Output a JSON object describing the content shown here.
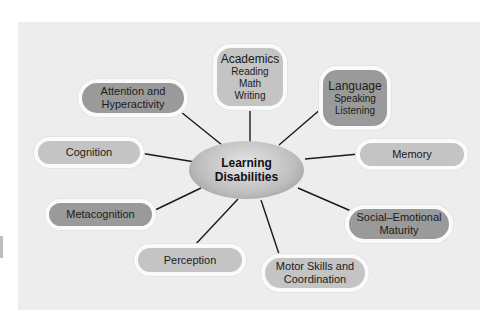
{
  "diagram": {
    "type": "mind-map",
    "center": {
      "line1": "Learning",
      "line2": "Disabilities"
    },
    "nodes": {
      "academics": {
        "title": "Academics",
        "items": [
          "Reading",
          "Math",
          "Writing"
        ],
        "shade": "light"
      },
      "language": {
        "title": "Language",
        "items": [
          "Speaking",
          "Listening"
        ],
        "shade": "dark"
      },
      "attention": {
        "line1": "Attention and",
        "line2": "Hyperactivity",
        "shade": "dark"
      },
      "cognition": {
        "label": "Cognition",
        "shade": "light"
      },
      "memory": {
        "label": "Memory",
        "shade": "light"
      },
      "metacognition": {
        "label": "Metacognition",
        "shade": "dark"
      },
      "social": {
        "line1": "Social–Emotional",
        "line2": "Maturity",
        "shade": "dark"
      },
      "perception": {
        "label": "Perception",
        "shade": "light"
      },
      "motor": {
        "line1": "Motor Skills and",
        "line2": "Coordination",
        "shade": "light"
      }
    },
    "colors": {
      "background": "#ededed",
      "dark_node": "#9a9a9a",
      "light_node": "#c4c4c4",
      "node_border": "#fafafa",
      "connector": "#1a1a1a"
    }
  }
}
